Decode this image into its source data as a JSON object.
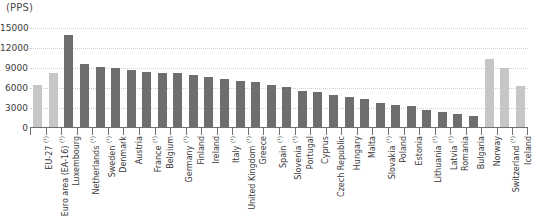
{
  "chart_data": {
    "type": "bar",
    "title": "",
    "unit_label": "(PPS)",
    "xlabel": "",
    "ylabel": "",
    "ylim": [
      0,
      15000
    ],
    "ytick_values": [
      0,
      3000,
      6000,
      9000,
      12000,
      15000
    ],
    "ytick_labels": [
      "0",
      "3000",
      "6000",
      "9000",
      "12000",
      "15000"
    ],
    "grid": true,
    "legend": "none",
    "categories": [
      "EU-27 (¹)",
      "Euro area (EA-16) (¹)",
      "Luxembourg",
      "Netherlands (¹)",
      "Sweden (¹)",
      "Denmark",
      "Austria",
      "France (¹)",
      "Belgium",
      "Germany (¹)",
      "Finland",
      "Ireland",
      "Italy (¹)",
      "United Kingdom (¹)",
      "Greece",
      "Spain (¹)",
      "Slovenia (¹)",
      "Portugal",
      "Cyprus",
      "Czech Republic",
      "Hungary",
      "Malta",
      "Slovakia (¹)",
      "Poland",
      "Estonia",
      "Lithuania (¹)",
      "Latvia (¹)",
      "Romania",
      "Bulgaria",
      "Norway",
      "Switzerland (¹)",
      "Iceland"
    ],
    "values": [
      6400,
      8200,
      14000,
      9600,
      9100,
      9000,
      8700,
      8400,
      8300,
      8200,
      7900,
      7700,
      7400,
      7100,
      6900,
      6400,
      6200,
      5500,
      5400,
      5000,
      4700,
      4300,
      3800,
      3500,
      3300,
      2700,
      2400,
      2100,
      1800,
      10300,
      9000,
      6300
    ],
    "bar_colors": [
      "light",
      "light",
      "dark",
      "dark",
      "dark",
      "dark",
      "dark",
      "dark",
      "dark",
      "dark",
      "dark",
      "dark",
      "dark",
      "dark",
      "dark",
      "dark",
      "dark",
      "dark",
      "dark",
      "dark",
      "dark",
      "dark",
      "dark",
      "dark",
      "dark",
      "dark",
      "dark",
      "dark",
      "dark",
      "light",
      "light",
      "light"
    ],
    "colors": {
      "dark_bar": "#6e6e6e",
      "light_bar": "#c6c6c6",
      "gridline": "#cfcfcf",
      "axis": "#6f6f6f",
      "text": "#3a3a3a",
      "background": "#ffffff"
    }
  }
}
